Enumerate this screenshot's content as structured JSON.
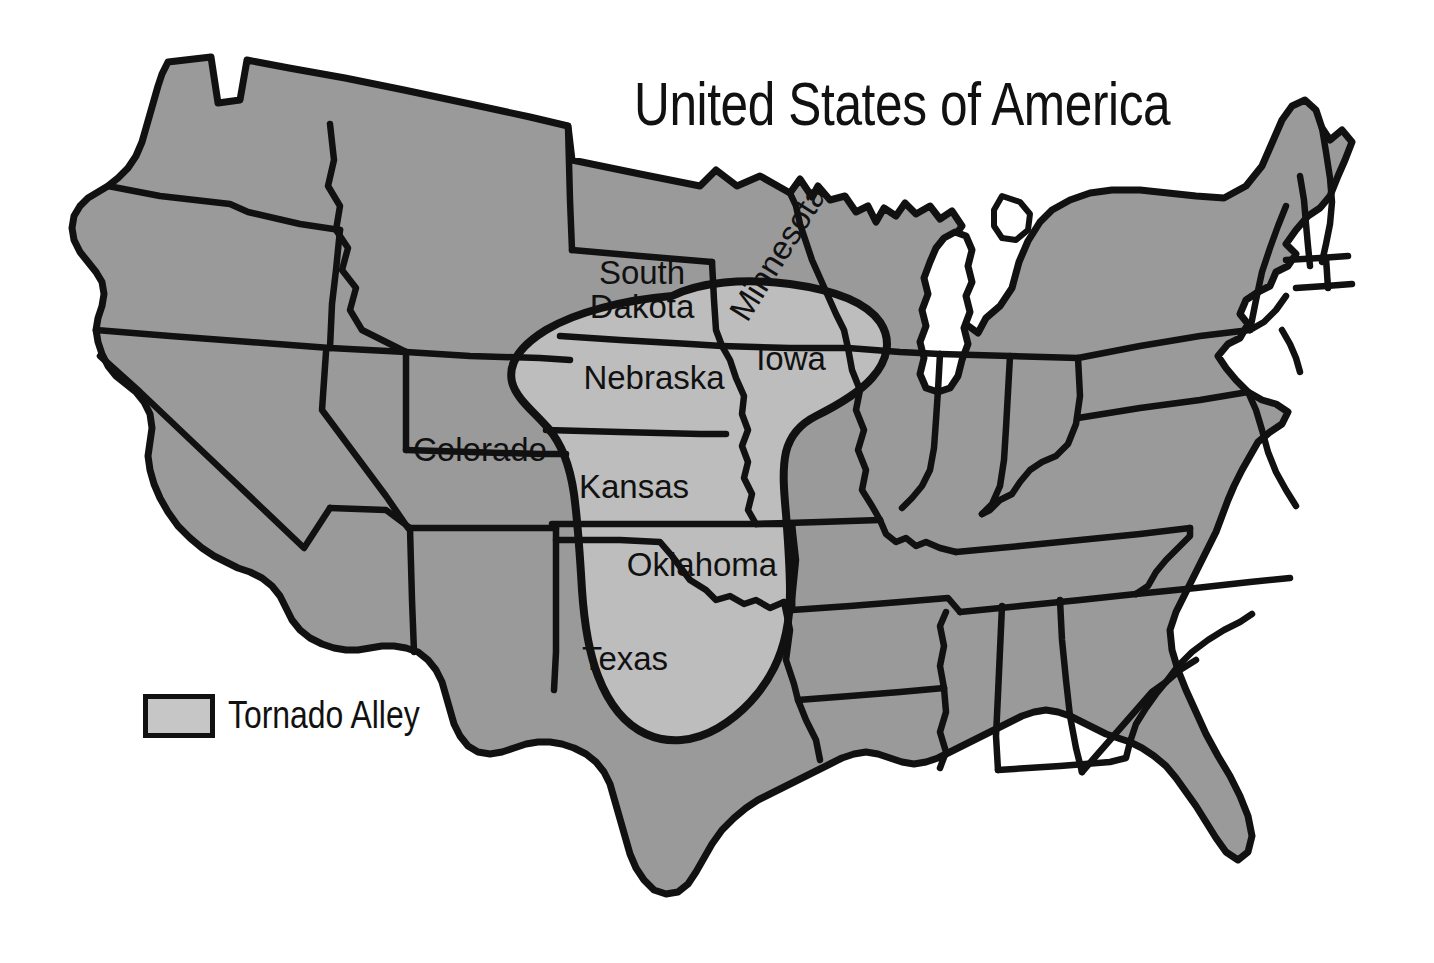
{
  "title": "United States of America",
  "legend": {
    "label": "Tornado Alley",
    "swatch_color": "#c6c6c6",
    "swatch_border_color": "#111111"
  },
  "colors": {
    "background": "#ffffff",
    "state_fill": "#9a9a9a",
    "tornado_alley_fill": "#bdbdbd",
    "border": "#111111",
    "water_fill": "#ffffff",
    "text": "#111111"
  },
  "map": {
    "region_name": "Tornado Alley",
    "country": "United States of America",
    "projection_note": "contiguous United States, state boundaries",
    "labeled_states": [
      {
        "name": "South Dakota",
        "lines": [
          "South",
          "Dakota"
        ],
        "x": 642,
        "y": 294,
        "rotation": 0,
        "in_tornado_alley": true
      },
      {
        "name": "Minnesota",
        "lines": [
          "Minnesota"
        ],
        "x": 778,
        "y": 252,
        "rotation": -58,
        "in_tornado_alley": true
      },
      {
        "name": "Iowa",
        "lines": [
          "Iowa"
        ],
        "x": 791,
        "y": 361,
        "rotation": 0,
        "in_tornado_alley": true
      },
      {
        "name": "Nebraska",
        "lines": [
          "Nebraska"
        ],
        "x": 654,
        "y": 380,
        "rotation": 0,
        "in_tornado_alley": true
      },
      {
        "name": "Colorado",
        "lines": [
          "Colorado"
        ],
        "x": 480,
        "y": 452,
        "rotation": 0,
        "in_tornado_alley": false
      },
      {
        "name": "Kansas",
        "lines": [
          "Kansas"
        ],
        "x": 634,
        "y": 489,
        "rotation": 0,
        "in_tornado_alley": true
      },
      {
        "name": "Oklahoma",
        "lines": [
          "Oklahoma"
        ],
        "x": 702,
        "y": 567,
        "rotation": 0,
        "in_tornado_alley": true
      },
      {
        "name": "Texas",
        "lines": [
          "Texas"
        ],
        "x": 625,
        "y": 661,
        "rotation": 0,
        "in_tornado_alley": true
      }
    ],
    "tornado_alley_states": [
      "South Dakota",
      "Minnesota",
      "Iowa",
      "Nebraska",
      "Kansas",
      "Oklahoma",
      "Texas"
    ]
  }
}
